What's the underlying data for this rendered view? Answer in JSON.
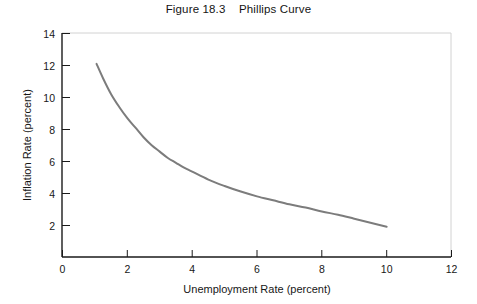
{
  "figure": {
    "title": "Figure 18.3    Phillips Curve"
  },
  "chart_data": {
    "type": "line",
    "title": "Figure 18.3    Phillips Curve",
    "xlabel": "Unemployment Rate (percent)",
    "ylabel": "Inflation Rate (percent)",
    "xlim": [
      0,
      12
    ],
    "ylim": [
      0,
      14
    ],
    "xticks": [
      0,
      2,
      4,
      6,
      8,
      10,
      12
    ],
    "yticks": [
      0,
      2,
      4,
      6,
      8,
      10,
      12,
      14
    ],
    "grid": false,
    "legend": null,
    "series": [
      {
        "name": "Phillips curve",
        "color": "#7c7c7c",
        "linewidth": 2,
        "x": [
          1.05,
          1.25,
          1.5,
          1.75,
          2.0,
          2.25,
          2.5,
          2.75,
          3.0,
          3.25,
          3.5,
          3.75,
          4.0,
          4.5,
          5.0,
          5.5,
          6.0,
          6.5,
          7.0,
          7.5,
          8.0,
          8.5,
          9.0,
          9.5,
          10.0
        ],
        "y": [
          12.1,
          11.2,
          10.2,
          9.4,
          8.7,
          8.1,
          7.5,
          7.0,
          6.6,
          6.2,
          5.9,
          5.6,
          5.35,
          4.85,
          4.45,
          4.1,
          3.8,
          3.55,
          3.3,
          3.1,
          2.85,
          2.65,
          2.4,
          2.15,
          1.9
        ]
      }
    ]
  },
  "axes": {
    "x_tick_labels": [
      "0",
      "2",
      "4",
      "6",
      "8",
      "10",
      "12"
    ],
    "y_tick_labels": [
      "2",
      "4",
      "6",
      "8",
      "10",
      "12",
      "14"
    ],
    "x_axis_title": "Unemployment Rate (percent)",
    "y_axis_title": "Inflation Rate (percent)"
  },
  "colors": {
    "curve": "#7c7c7c",
    "axis": "#1a1a1a",
    "frame": "#cfcfcf",
    "background": "#ffffff"
  }
}
